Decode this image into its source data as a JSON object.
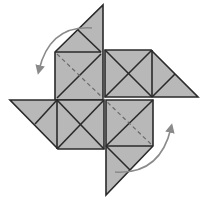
{
  "diagram": {
    "colors": {
      "fill": "#b8b8b8",
      "stroke": "#2a2a2a",
      "arrow": "#8a8a8a",
      "dashed": "#6a6a6a",
      "background": "#ffffff"
    },
    "arms": [
      {
        "name": "top-arm",
        "direction": "up"
      },
      {
        "name": "right-arm",
        "direction": "right"
      },
      {
        "name": "bottom-arm",
        "direction": "down"
      },
      {
        "name": "left-arm",
        "direction": "left"
      }
    ],
    "arrows": [
      {
        "name": "top-left-rotate-arrow",
        "direction": "counterclockwise"
      },
      {
        "name": "bottom-right-rotate-arrow",
        "direction": "counterclockwise"
      }
    ],
    "fold_line": {
      "style": "dashed",
      "from": "top-left",
      "to": "bottom-right"
    }
  }
}
